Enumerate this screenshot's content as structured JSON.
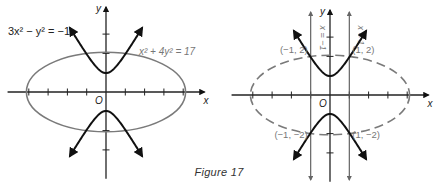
{
  "figure": {
    "caption": "Figure 17",
    "unit_px": 19.3,
    "colors": {
      "hyperbola": "#111111",
      "ellipse": "#7a7a7a",
      "axis": "#222222",
      "label_gray": "#777777",
      "label_dark": "#222222"
    },
    "left_graph": {
      "origin_px": [
        106,
        92
      ],
      "hyperbola_label": "3x² − y² = −1",
      "ellipse_label": "x² + 4y² = 17",
      "x_axis_label": "x",
      "y_axis_label": "y",
      "origin_label": "O",
      "ellipse_style": "solid"
    },
    "right_graph": {
      "origin_px": [
        330,
        95
      ],
      "x_axis_label": "x",
      "y_axis_label": "y",
      "origin_label": "O",
      "ellipse_style": "dashed",
      "vertical_lines": [
        {
          "label": "x = −1",
          "x": -1
        },
        {
          "label": "x = 1",
          "x": 1
        }
      ],
      "points": [
        {
          "label": "(−1, 2)",
          "x": -1,
          "y": 2
        },
        {
          "label": "(1, 2)",
          "x": 1,
          "y": 2
        },
        {
          "label": "(−1, −2)",
          "x": -1,
          "y": -2
        },
        {
          "label": "(1, −2)",
          "x": 1,
          "y": -2
        }
      ]
    }
  },
  "chart_data": {
    "type": "line",
    "title": "Figure 17",
    "curves": [
      {
        "name": "hyperbola",
        "equation": "3x^2 - y^2 = -1",
        "vertices": [
          [
            0,
            0.577
          ],
          [
            0,
            -0.577
          ]
        ]
      },
      {
        "name": "ellipse",
        "equation": "x^2 + 4y^2 = 17",
        "semi_axes": [
          4.123,
          2.062
        ]
      }
    ],
    "intersections": [
      [
        -1,
        2
      ],
      [
        1,
        2
      ],
      [
        -1,
        -2
      ],
      [
        1,
        -2
      ]
    ],
    "xlabel": "x",
    "ylabel": "y",
    "xlim": [
      -5,
      5
    ],
    "ylim": [
      -4,
      4
    ],
    "x_ticks": [
      -4,
      -3,
      -2,
      -1,
      1,
      2,
      3,
      4
    ],
    "y_ticks": [
      -3,
      -2,
      1,
      2,
      3
    ]
  }
}
